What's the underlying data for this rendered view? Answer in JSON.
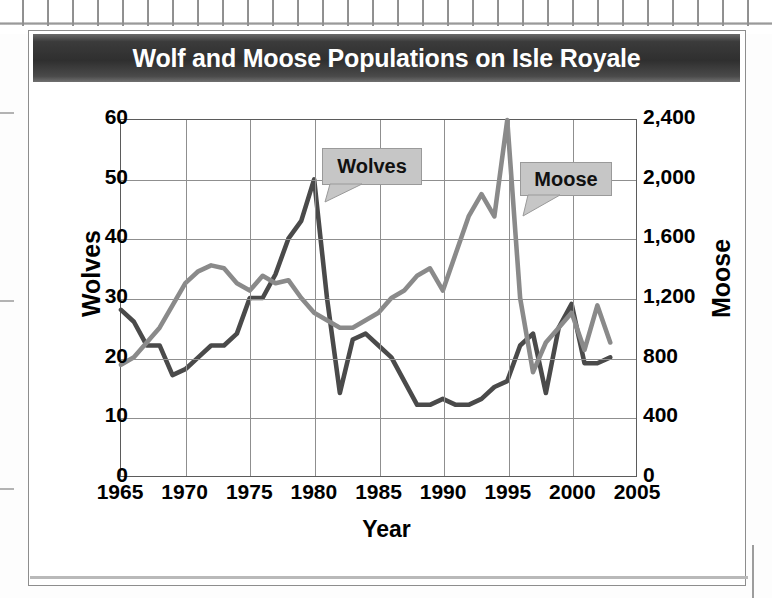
{
  "page": {
    "title": "Wolf and Moose Populations on Isle Royale"
  },
  "chart_data": {
    "type": "line",
    "title": "Wolf and Moose Populations on Isle Royale",
    "xlabel": "Year",
    "ylabel": "Wolves",
    "y2label": "Moose",
    "xlim": [
      1965,
      2005
    ],
    "ylim": [
      0,
      60
    ],
    "y2lim": [
      0,
      2400
    ],
    "grid": true,
    "legend": "inline-callouts",
    "xticks": [
      "1965",
      "1970",
      "1975",
      "1980",
      "1985",
      "1990",
      "1995",
      "2000",
      "2005"
    ],
    "yticks_left": [
      "0",
      "10",
      "20",
      "30",
      "40",
      "50",
      "60"
    ],
    "yticks_right": [
      "0",
      "400",
      "800",
      "1,200",
      "1,600",
      "2,000",
      "2,400"
    ],
    "annotations": [
      {
        "label": "Wolves",
        "points_to_series": "Wolves"
      },
      {
        "label": "Moose",
        "points_to_series": "Moose"
      }
    ],
    "x": [
      1965,
      1966,
      1967,
      1968,
      1969,
      1970,
      1971,
      1972,
      1973,
      1974,
      1975,
      1976,
      1977,
      1978,
      1979,
      1980,
      1981,
      1982,
      1983,
      1984,
      1985,
      1986,
      1987,
      1988,
      1989,
      1990,
      1991,
      1992,
      1993,
      1994,
      1995,
      1996,
      1997,
      1998,
      1999,
      2000,
      2001,
      2002,
      2003
    ],
    "series": [
      {
        "name": "Wolves",
        "axis": "left",
        "color": "#4a4a4a",
        "values": [
          28,
          26,
          22,
          22,
          17,
          18,
          20,
          22,
          22,
          24,
          30,
          30,
          34,
          40,
          43,
          50,
          30,
          14,
          23,
          24,
          22,
          20,
          16,
          12,
          12,
          13,
          12,
          12,
          13,
          15,
          16,
          22,
          24,
          14,
          25,
          29,
          19,
          19,
          20
        ]
      },
      {
        "name": "Moose",
        "axis": "right",
        "color": "#8a8a8a",
        "values": [
          750,
          800,
          900,
          1000,
          1150,
          1300,
          1380,
          1420,
          1400,
          1300,
          1250,
          1350,
          1300,
          1320,
          1200,
          1100,
          1050,
          1000,
          1000,
          1050,
          1100,
          1200,
          1250,
          1350,
          1400,
          1250,
          1500,
          1750,
          1900,
          1750,
          2400,
          1200,
          700,
          900,
          1000,
          1100,
          850,
          1150,
          900
        ]
      }
    ]
  }
}
